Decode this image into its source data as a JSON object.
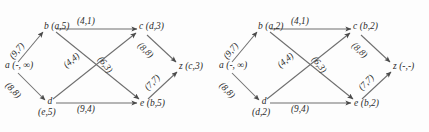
{
  "figure": {
    "kind": "two-panel-directed-graph"
  },
  "colors": {
    "background": "#fdfdfd",
    "edge": "#6e6e6e",
    "arrow": "#4a4a4a",
    "text": "#2b2b2b"
  },
  "graphs": [
    {
      "id": "left",
      "nodes": [
        {
          "id": "a",
          "name": "a",
          "pair": "(-, ∞)",
          "layout": "mid-left",
          "pair_position": "right"
        },
        {
          "id": "b",
          "name": "b",
          "pair": "(a,5)",
          "layout": "top-left",
          "pair_position": "right"
        },
        {
          "id": "d",
          "name": "d",
          "pair": "(e,5)",
          "layout": "bottom-left",
          "pair_position": "below"
        },
        {
          "id": "c",
          "name": "c",
          "pair": "(d,3)",
          "layout": "top-right",
          "pair_position": "right"
        },
        {
          "id": "e",
          "name": "e",
          "pair": "(b,5)",
          "layout": "bottom-right",
          "pair_position": "right"
        },
        {
          "id": "z",
          "name": "z",
          "pair": "(c,3)",
          "layout": "mid-right",
          "pair_position": "right"
        }
      ],
      "edges": [
        {
          "from": "a",
          "to": "b",
          "label": "(9,7)"
        },
        {
          "from": "a",
          "to": "d",
          "label": "(8,8)"
        },
        {
          "from": "b",
          "to": "c",
          "label": "(4,1)"
        },
        {
          "from": "b",
          "to": "e",
          "label": "(6,3)"
        },
        {
          "from": "d",
          "to": "c",
          "label": "(4,4)"
        },
        {
          "from": "d",
          "to": "e",
          "label": "(9,4)"
        },
        {
          "from": "c",
          "to": "z",
          "label": "(8,8)"
        },
        {
          "from": "e",
          "to": "z",
          "label": "(7,7)"
        }
      ]
    },
    {
      "id": "right",
      "nodes": [
        {
          "id": "a",
          "name": "a",
          "pair": "(-, ∞)",
          "layout": "mid-left",
          "pair_position": "right"
        },
        {
          "id": "b",
          "name": "b",
          "pair": "(a,2)",
          "layout": "top-left",
          "pair_position": "right"
        },
        {
          "id": "d",
          "name": "d",
          "pair": "(d,2)",
          "layout": "bottom-left",
          "pair_position": "below"
        },
        {
          "id": "c",
          "name": "c",
          "pair": "(b,2)",
          "layout": "top-right",
          "pair_position": "right"
        },
        {
          "id": "e",
          "name": "e",
          "pair": "(b,2)",
          "layout": "bottom-right",
          "pair_position": "right"
        },
        {
          "id": "z",
          "name": "z",
          "pair": "(-,-)",
          "layout": "mid-right",
          "pair_position": "right"
        }
      ],
      "edges": [
        {
          "from": "a",
          "to": "b",
          "label": "(9,7)"
        },
        {
          "from": "a",
          "to": "d",
          "label": "(8,8)"
        },
        {
          "from": "b",
          "to": "c",
          "label": "(4,1)"
        },
        {
          "from": "b",
          "to": "e",
          "label": "(6,3)"
        },
        {
          "from": "d",
          "to": "c",
          "label": "(4,4)"
        },
        {
          "from": "d",
          "to": "e",
          "label": "(9,4)"
        },
        {
          "from": "c",
          "to": "z",
          "label": "(8,8)"
        },
        {
          "from": "e",
          "to": "z",
          "label": "(7,7)"
        }
      ]
    }
  ]
}
